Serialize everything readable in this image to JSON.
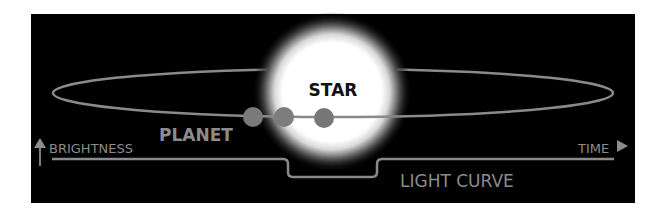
{
  "diagram": {
    "labels": {
      "star": "STAR",
      "planet": "PLANET",
      "brightness": "BRIGHTNESS",
      "time": "TIME",
      "light_curve": "LIGHT CURVE"
    },
    "colors": {
      "background": "#000000",
      "star_core": "#ffffff",
      "orbit": "#8a8a8a",
      "planet": "#7a7a7a",
      "text": "#8c8c8c",
      "star_text": "#111111"
    },
    "elements": {
      "star": {
        "cx": 332,
        "cy": 92,
        "r": 58
      },
      "orbit": {
        "cx": 333,
        "cy": 93,
        "rx": 280,
        "ry": 24
      },
      "planets": [
        {
          "cx": 253,
          "cy": 117,
          "r": 10
        },
        {
          "cx": 284,
          "cy": 117,
          "r": 10
        },
        {
          "cx": 324,
          "cy": 118,
          "r": 10
        }
      ],
      "light_curve": {
        "baseline_y": 159,
        "dip_y": 177,
        "dip_start_x": 285,
        "dip_end_x": 381
      }
    }
  }
}
